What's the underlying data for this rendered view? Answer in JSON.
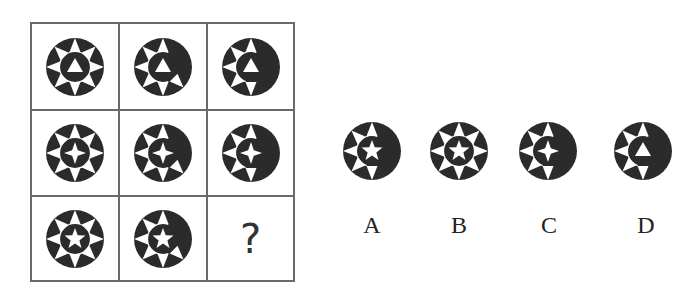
{
  "puzzle": {
    "grid": [
      [
        {
          "center": "triangle",
          "teeth": 8
        },
        {
          "center": "triangle",
          "teeth": 6
        },
        {
          "center": "triangle",
          "teeth": 5
        }
      ],
      [
        {
          "center": "star4",
          "teeth": 8
        },
        {
          "center": "star4",
          "teeth": 6
        },
        {
          "center": "star4",
          "teeth": 5
        }
      ],
      [
        {
          "center": "star5",
          "teeth": 8
        },
        {
          "center": "star5",
          "teeth": 6
        },
        {
          "center": "missing",
          "label": "?"
        }
      ]
    ],
    "question_mark": "?",
    "options": [
      {
        "label": "A",
        "center": "star5",
        "teeth": 5
      },
      {
        "label": "B",
        "center": "star5",
        "teeth": 8
      },
      {
        "label": "C",
        "center": "star4",
        "teeth": 5
      },
      {
        "label": "D",
        "center": "triangle",
        "teeth": 5
      }
    ],
    "colors": {
      "fill": "#2b2b2b",
      "background": "#ffffff",
      "grid_line": "#6a6a6a"
    }
  }
}
